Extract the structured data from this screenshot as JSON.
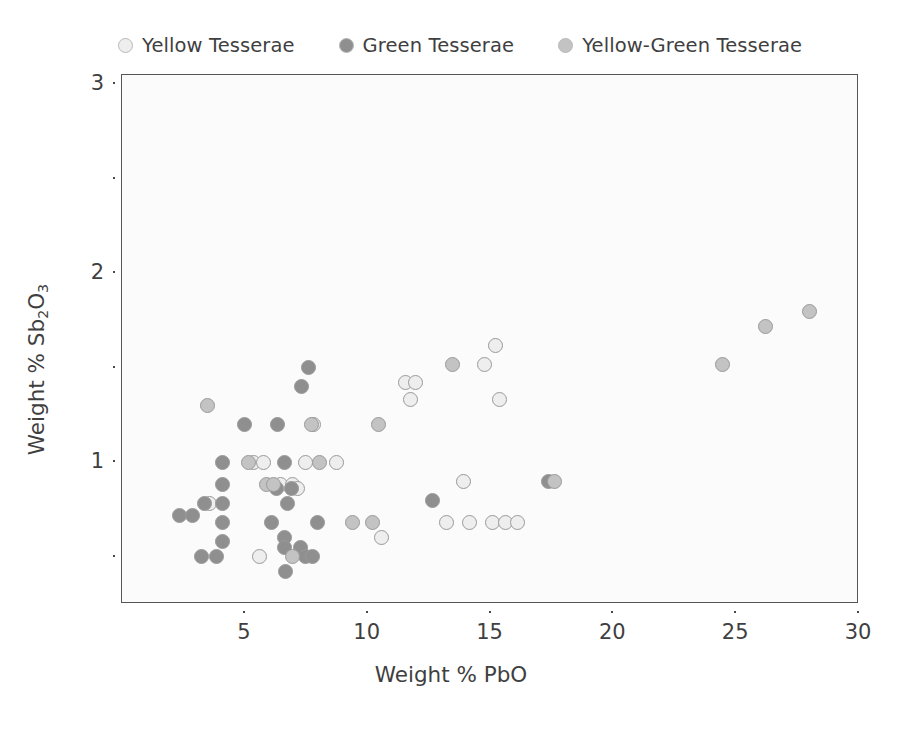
{
  "chart_data": {
    "type": "scatter",
    "title": "",
    "xlabel": "Weight % PbO",
    "ylabel": "Weight % Sb2O3",
    "ylabel_parts": {
      "prefix": "Weight % Sb",
      "sub1": "2",
      "mid": "O",
      "sub2": "3"
    },
    "xlim": [
      0,
      30
    ],
    "ylim": [
      0.25,
      3.05
    ],
    "xticks": [
      5,
      10,
      15,
      20,
      25,
      30
    ],
    "xtick_labels": [
      "5",
      "10",
      "15",
      "20",
      "25",
      "30"
    ],
    "yticks": [
      0.5,
      1,
      1.5,
      2,
      2.5,
      3
    ],
    "ytick_labels": [
      "",
      "1",
      "",
      "2",
      "",
      "3"
    ],
    "grid": false,
    "legend_position": "above-plot",
    "colors": {
      "yellow": "#eeeeee",
      "green": "#8f8f8f",
      "yellow_green": "#c3c3c3",
      "marker_edge": "#9a9a9a",
      "axis": "#55555a",
      "text": "#3f3f3f",
      "plot_background": "#fbfbfb"
    },
    "series": [
      {
        "name": "Yellow Tesserae",
        "color": "#eeeeee",
        "points": [
          [
            3.55,
            0.78
          ],
          [
            5.35,
            1.0
          ],
          [
            5.75,
            1.0
          ],
          [
            6.45,
            0.88
          ],
          [
            6.95,
            0.88
          ],
          [
            7.45,
            1.0
          ],
          [
            7.15,
            0.86
          ],
          [
            7.8,
            1.2
          ],
          [
            8.75,
            1.0
          ],
          [
            5.6,
            0.5
          ],
          [
            10.55,
            0.6
          ],
          [
            11.55,
            1.42
          ],
          [
            11.95,
            1.42
          ],
          [
            11.75,
            1.33
          ],
          [
            13.9,
            0.9
          ],
          [
            13.2,
            0.68
          ],
          [
            14.15,
            0.68
          ],
          [
            14.75,
            1.52
          ],
          [
            15.2,
            1.62
          ],
          [
            15.35,
            1.33
          ],
          [
            15.1,
            0.68
          ],
          [
            15.6,
            0.68
          ],
          [
            16.1,
            0.68
          ]
        ]
      },
      {
        "name": "Green Tesserae",
        "color": "#8f8f8f",
        "points": [
          [
            2.35,
            0.72
          ],
          [
            2.85,
            0.72
          ],
          [
            3.35,
            0.78
          ],
          [
            4.1,
            1.0
          ],
          [
            4.1,
            0.88
          ],
          [
            4.1,
            0.78
          ],
          [
            4.1,
            0.68
          ],
          [
            4.1,
            0.58
          ],
          [
            3.25,
            0.5
          ],
          [
            3.85,
            0.5
          ],
          [
            5.0,
            1.2
          ],
          [
            6.35,
            1.2
          ],
          [
            6.6,
            1.0
          ],
          [
            6.3,
            0.86
          ],
          [
            6.9,
            0.86
          ],
          [
            7.3,
            1.4
          ],
          [
            7.6,
            1.5
          ],
          [
            6.75,
            0.78
          ],
          [
            6.6,
            0.6
          ],
          [
            6.6,
            0.55
          ],
          [
            6.65,
            0.42
          ],
          [
            7.25,
            0.55
          ],
          [
            7.45,
            0.5
          ],
          [
            7.75,
            0.5
          ],
          [
            7.95,
            0.68
          ],
          [
            6.1,
            0.68
          ],
          [
            12.65,
            0.8
          ],
          [
            17.35,
            0.9
          ]
        ]
      },
      {
        "name": "Yellow-Green Tesserae",
        "color": "#c3c3c3",
        "points": [
          [
            3.5,
            1.3
          ],
          [
            5.15,
            1.0
          ],
          [
            5.9,
            0.88
          ],
          [
            6.15,
            0.88
          ],
          [
            7.7,
            1.2
          ],
          [
            8.05,
            1.0
          ],
          [
            6.95,
            0.5
          ],
          [
            9.4,
            0.68
          ],
          [
            10.2,
            0.68
          ],
          [
            10.45,
            1.2
          ],
          [
            13.45,
            1.52
          ],
          [
            17.6,
            0.9
          ],
          [
            24.45,
            1.52
          ],
          [
            26.2,
            1.72
          ],
          [
            28.0,
            1.8
          ]
        ]
      }
    ]
  },
  "legend": {
    "entries": [
      {
        "label": "Yellow Tesserae",
        "color": "#eeeeee"
      },
      {
        "label": "Green Tesserae",
        "color": "#8f8f8f"
      },
      {
        "label": "Yellow-Green Tesserae",
        "color": "#c3c3c3"
      }
    ]
  }
}
